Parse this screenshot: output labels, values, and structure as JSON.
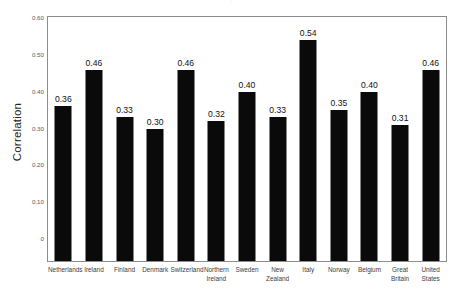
{
  "figure": {
    "title_remnant": "·",
    "background": "#ffffff",
    "frame_color": "#8c8c8c",
    "bar_color": "#0a0a0a"
  },
  "chart_data": {
    "type": "bar",
    "title": "",
    "xlabel": "",
    "ylabel": "Correlation",
    "ylim": [
      0,
      0.6
    ],
    "yticks": [
      0,
      0.1,
      0.2,
      0.3,
      0.4,
      0.5,
      0.6
    ],
    "ytick_labels": [
      "0",
      "0.10",
      "0.20",
      "0.30",
      "0.40",
      "0.50",
      "0.60"
    ],
    "grid": false,
    "legend": null,
    "legend_position": "none",
    "categories": [
      "Netherlands",
      "Ireland",
      "Finland",
      "Denmark",
      "Switzerland",
      "Northern\nIreland",
      "Sweden",
      "New\nZealand",
      "Italy",
      "Norway",
      "Belgium",
      "Great\nBritain",
      "United\nStates"
    ],
    "values": [
      0.36,
      0.46,
      0.33,
      0.3,
      0.46,
      0.32,
      0.4,
      0.33,
      0.54,
      0.35,
      0.4,
      0.31,
      0.46
    ],
    "value_labels": [
      "0.36",
      "0.46",
      "0.33",
      "0.30",
      "0.46",
      "0.32",
      "0.40",
      "0.33",
      "0.54",
      "0.35",
      "0.40",
      "0.31",
      "0.46"
    ]
  }
}
